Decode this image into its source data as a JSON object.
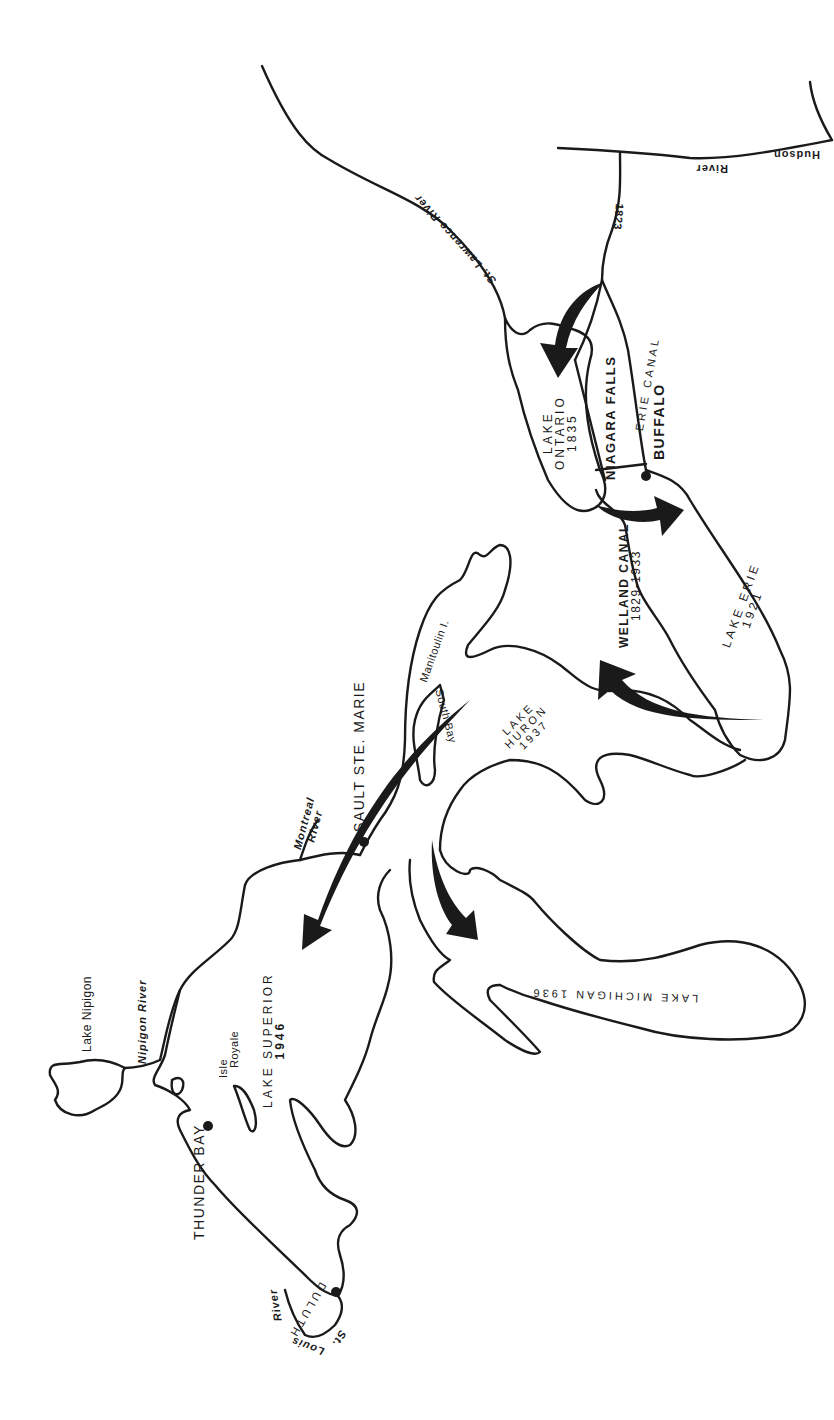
{
  "map": {
    "title": "Great Lakes navigation route (rotated map)",
    "colors": {
      "ink": "#1a1a1a",
      "paper": "#ffffff"
    },
    "lakes": [
      {
        "name": "LAKE ONTARIO",
        "year": "1835"
      },
      {
        "name": "LAKE ERIE",
        "year": "1921"
      },
      {
        "name": "LAKE HURON",
        "year": "1937"
      },
      {
        "name": "LAKE MICHIGAN",
        "year": "1936"
      },
      {
        "name": "LAKE SUPERIOR",
        "year": "1946"
      }
    ],
    "lake_labels": {
      "ontario_line1": "LAKE",
      "ontario_line2": "ONTARIO",
      "ontario_year": "1835",
      "erie_line1": "LAKE ERIE",
      "erie_year": "1921",
      "huron_line1": "LAKE",
      "huron_line2": "HURON",
      "huron_year": "1937",
      "michigan": "LAKE MICHIGAN 1936",
      "superior_line1": "LAKE SUPERIOR",
      "superior_year": "1946",
      "nipigon": "Lake Nipigon"
    },
    "canals": {
      "erie": "ERIE CANAL",
      "erie_year": "1823",
      "welland": "WELLAND CANAL",
      "welland_years": "1829-1933",
      "niagara": "NIAGARA FALLS"
    },
    "rivers": {
      "st_lawrence": "St. Lawrence River",
      "hudson": "Hudson",
      "hudson_river": "River",
      "montreal": "Montreal",
      "montreal_river": "River",
      "nipigon": "Nipigon River",
      "st_louis_st": "St.",
      "st_louis_louis": "Louis",
      "st_louis_river": "River"
    },
    "islands": {
      "manitoulin": "Manitoulin I.",
      "isle_royale_1": "Isle",
      "isle_royale_2": "Royale",
      "south_bay": "South Bay"
    },
    "cities": {
      "buffalo": "BUFFALO",
      "sault": "SAULT STE. MARIE",
      "thunder_bay": "THUNDER BAY",
      "duluth": "DULUTH"
    }
  }
}
